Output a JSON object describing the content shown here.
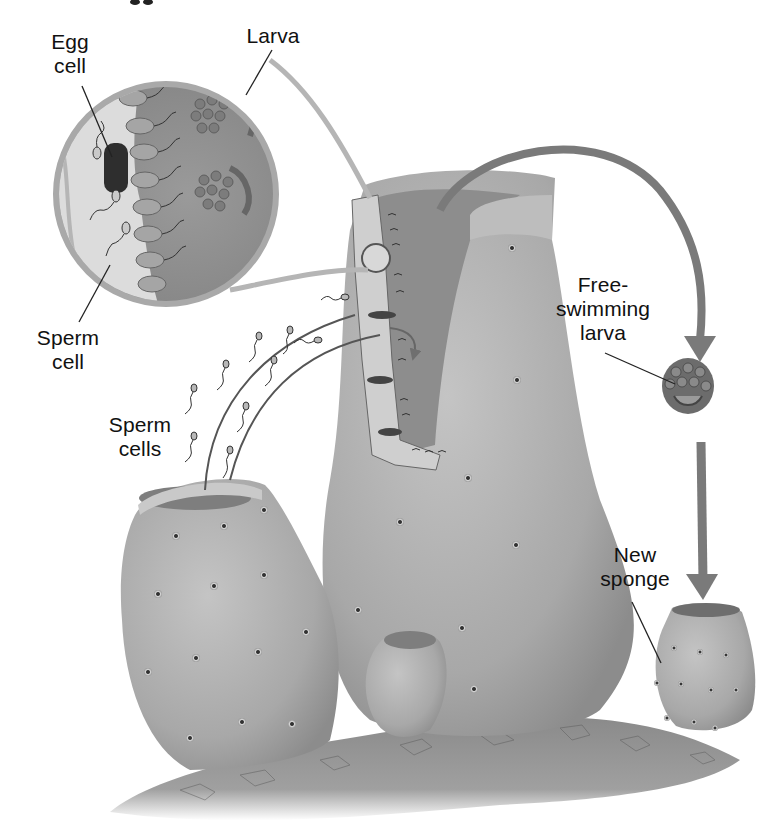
{
  "figure": {
    "title_fragment": "gg"
  },
  "labels": {
    "egg_cell": "Egg\ncell",
    "larva": "Larva",
    "sperm_cell": "Sperm\ncell",
    "sperm_cells": "Sperm\ncells",
    "free_swimming_larva": "Free-\nswimming\nlarva",
    "new_sponge": "New\nsponge"
  },
  "colors": {
    "background": "#ffffff",
    "sponge_body": "#a9a9a9",
    "sponge_dark": "#8a8a8a",
    "inset_fill": "#8f8f8f",
    "inset_light": "#d6d6d6",
    "arrow": "#7a7a7a",
    "label_text": "#111111",
    "leader_line": "#222222",
    "rock": "#8c8c8c"
  }
}
